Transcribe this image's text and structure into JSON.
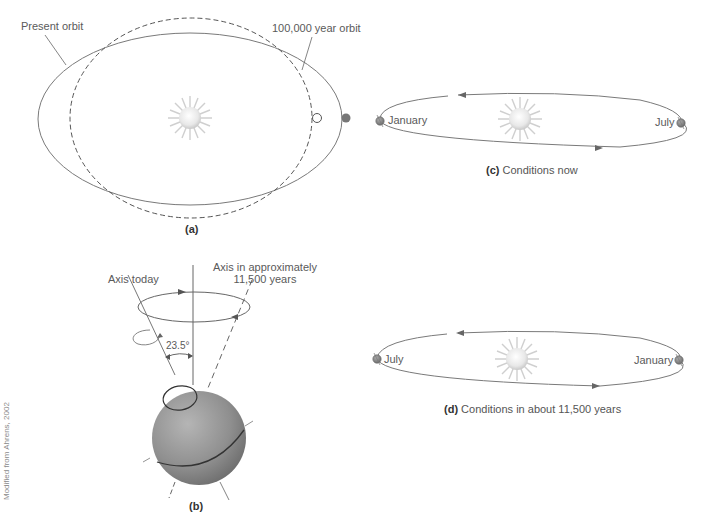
{
  "panel_a": {
    "caption": "(a)",
    "labels": {
      "present_orbit": "Present orbit",
      "future_orbit": "100,000 year orbit"
    }
  },
  "panel_b": {
    "caption": "(b)",
    "labels": {
      "axis_today": "Axis today",
      "axis_future_line1": "Axis in approximately",
      "axis_future_line2": "11,500 years",
      "tilt_angle": "23.5°"
    }
  },
  "panel_c": {
    "caption_letter": "(c)",
    "caption_text": "Conditions now",
    "left_label": "January",
    "right_label": "July"
  },
  "panel_d": {
    "caption_letter": "(d)",
    "caption_text": "Conditions in about 11,500 years",
    "left_label": "July",
    "right_label": "January"
  },
  "credit": "Modified from Ahrens, 2002",
  "colors": {
    "line": "#7a7a7a",
    "earth": "#8c8c8c",
    "sun_core": "#f2f2f2",
    "sun_rays": "#c8c8c8"
  }
}
